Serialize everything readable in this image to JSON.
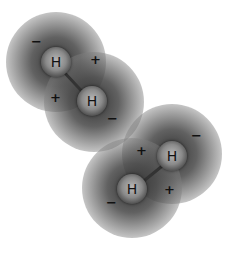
{
  "figure": {
    "molecules": [
      {
        "atoms": [
          {
            "label": "H",
            "x": 56,
            "y": 62
          },
          {
            "label": "H",
            "x": 92,
            "y": 101
          }
        ],
        "charges": [
          {
            "symbol": "−",
            "x": 36,
            "y": 42
          },
          {
            "symbol": "+",
            "x": 95,
            "y": 60
          },
          {
            "symbol": "+",
            "x": 55,
            "y": 98
          },
          {
            "symbol": "−",
            "x": 112,
            "y": 119
          }
        ]
      },
      {
        "atoms": [
          {
            "label": "H",
            "x": 172,
            "y": 156
          },
          {
            "label": "H",
            "x": 132,
            "y": 189
          }
        ],
        "charges": [
          {
            "symbol": "+",
            "x": 141,
            "y": 151
          },
          {
            "symbol": "−",
            "x": 196,
            "y": 136
          },
          {
            "symbol": "+",
            "x": 169,
            "y": 190
          },
          {
            "symbol": "−",
            "x": 111,
            "y": 203
          }
        ]
      }
    ]
  }
}
